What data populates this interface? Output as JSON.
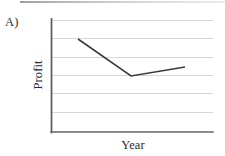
{
  "figure": {
    "part_label": "A)",
    "background_color": "#ffffff"
  },
  "chart_data": {
    "type": "line",
    "title": "",
    "subtitle": "",
    "xlabel": "Year",
    "ylabel": "Profit",
    "annotations": [
      "A)"
    ],
    "legend": [],
    "legend_position": "none",
    "grid": true,
    "grid_orientation": "horizontal",
    "grid_line_count": 7,
    "grid_color": "#d2d2d2",
    "axis_color": "#595959",
    "series_color": "#3a3a3a",
    "axes_ticks_shown": false,
    "xtick_labels": [],
    "ytick_labels": [],
    "xlim": [
      0,
      1
    ],
    "ylim": [
      0,
      1
    ],
    "x": [
      0.17,
      0.49,
      0.83
    ],
    "y": [
      0.82,
      0.5,
      0.58
    ],
    "series": [
      {
        "name": "Profit",
        "x": [
          0.17,
          0.49,
          0.83
        ],
        "values": [
          0.82,
          0.5,
          0.58
        ],
        "description": "declines steeply then recovers slightly"
      }
    ]
  },
  "geometry": {
    "plot_left": 51,
    "plot_right": 213,
    "plot_top": 19,
    "plot_bottom": 132,
    "gridline_y": [
      20,
      38,
      57,
      75,
      93,
      112,
      131
    ],
    "polyline_points": "78,39 131,76 185,67"
  }
}
